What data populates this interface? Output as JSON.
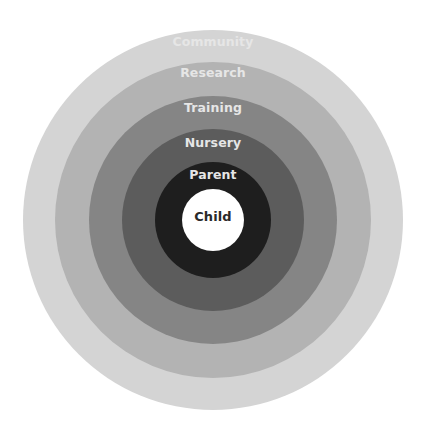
{
  "diagram": {
    "type": "concentric-circles",
    "center": {
      "x": 213,
      "y": 220
    },
    "rings": [
      {
        "id": "community",
        "label": "Community",
        "radius": 190,
        "color": "#d4d4d4",
        "label_y": 34
      },
      {
        "id": "research",
        "label": "Research",
        "radius": 158,
        "color": "#b3b3b3",
        "label_y": 65
      },
      {
        "id": "training",
        "label": "Training",
        "radius": 124,
        "color": "#858585",
        "label_y": 100
      },
      {
        "id": "nursery",
        "label": "Nursery",
        "radius": 91,
        "color": "#5c5c5c",
        "label_y": 135
      },
      {
        "id": "parent",
        "label": "Parent",
        "radius": 58,
        "color": "#1e1e1e",
        "label_y": 167
      },
      {
        "id": "child",
        "label": "Child",
        "radius": 31,
        "color": "#ffffff",
        "label_y": 209
      }
    ]
  }
}
